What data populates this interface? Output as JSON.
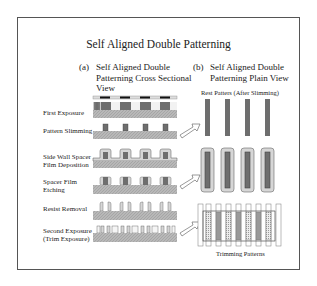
{
  "title": "Self Aligned Double Patterning",
  "panels": {
    "a": {
      "tag": "(a)",
      "line1": "Self Aligned Double",
      "line2": "Patterning Cross Sectional",
      "line3": "View"
    },
    "b": {
      "tag": "(b)",
      "line1": "Self Aligned Double",
      "line2": "Patterning Plain View"
    }
  },
  "steps": [
    {
      "line1": "First Exposure",
      "line2": ""
    },
    {
      "line1": "Pattern Slimming",
      "line2": ""
    },
    {
      "line1": "Side Wall Spacer",
      "line2": "Film Deposition"
    },
    {
      "line1": "Spacer Film",
      "line2": "Etching"
    },
    {
      "line1": "Resist Removal",
      "line2": ""
    },
    {
      "line1": "Second Exposure",
      "line2": "(Trim Exposure)"
    }
  ],
  "plain_view_labels": {
    "rest_patterns": "Rest Patters (After Slimming)",
    "trimming_patterns": "Trimming Patterns"
  },
  "colors": {
    "frame": "#555555",
    "resist": "#6e6e6e",
    "substrate": "#b8b8b8",
    "spacer": "#d6d6d6",
    "mask_dark": "#111111"
  }
}
